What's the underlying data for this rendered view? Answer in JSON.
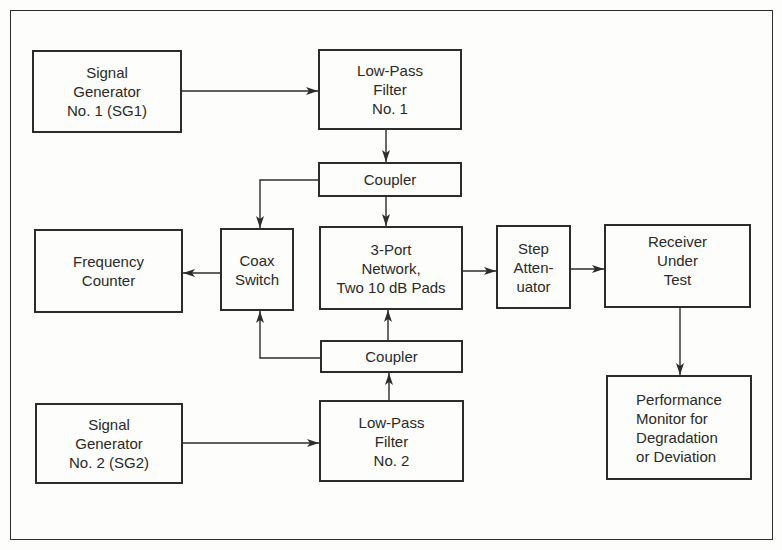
{
  "diagram": {
    "type": "block-diagram",
    "blocks": {
      "sg1": "Signal\nGenerator\nNo. 1 (SG1)",
      "lpf1": "Low-Pass\nFilter\nNo. 1",
      "coupler_top": "Coupler",
      "freq_counter": "Frequency\nCounter",
      "coax_switch": "Coax\nSwitch",
      "three_port": "3-Port\nNetwork,\nTwo 10 dB Pads",
      "step_attenuator": "Step\nAtten-\nuator",
      "receiver": "Receiver\nUnder\nTest",
      "coupler_bottom": "Coupler",
      "sg2": "Signal\nGenerator\nNo. 2 (SG2)",
      "lpf2": "Low-Pass\nFilter\nNo. 2",
      "perf_monitor": "Performance\nMonitor for\nDegradation\nor Deviation"
    },
    "connections": [
      {
        "from": "Signal Generator No. 1 (SG1)",
        "to": "Low-Pass Filter No. 1"
      },
      {
        "from": "Low-Pass Filter No. 1",
        "to": "Coupler (top)"
      },
      {
        "from": "Coupler (top)",
        "to": "3-Port Network, Two 10 dB Pads"
      },
      {
        "from": "Coupler (top)",
        "to": "Coax Switch"
      },
      {
        "from": "Signal Generator No. 2 (SG2)",
        "to": "Low-Pass Filter No. 2"
      },
      {
        "from": "Low-Pass Filter No. 2",
        "to": "Coupler (bottom)"
      },
      {
        "from": "Coupler (bottom)",
        "to": "3-Port Network, Two 10 dB Pads"
      },
      {
        "from": "Coupler (bottom)",
        "to": "Coax Switch"
      },
      {
        "from": "Coax Switch",
        "to": "Frequency Counter"
      },
      {
        "from": "3-Port Network, Two 10 dB Pads",
        "to": "Step Attenuator"
      },
      {
        "from": "Step Attenuator",
        "to": "Receiver Under Test"
      },
      {
        "from": "Receiver Under Test",
        "to": "Performance Monitor for Degradation or Deviation"
      }
    ],
    "colors": {
      "line": "#2c2c2c",
      "background": "#fdfdfb"
    }
  }
}
